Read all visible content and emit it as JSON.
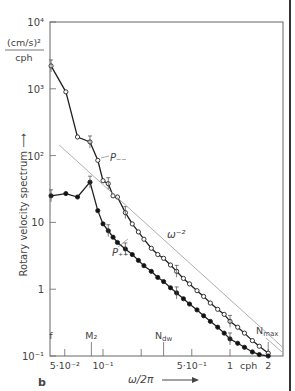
{
  "chart_data": {
    "type": "line",
    "panel_label": "b",
    "title": "",
    "xlabel": "ω/2π",
    "ylabel": "Rotary velocity spectrum",
    "y_units": {
      "numerator": "(cm/s)²",
      "denominator": "cph"
    },
    "x_scale": "log",
    "y_scale": "log",
    "xlim": [
      0.038,
      2.6
    ],
    "ylim": [
      0.1,
      10000
    ],
    "x_ticks": [
      {
        "value": 0.05,
        "label": "5·10⁻²"
      },
      {
        "value": 0.1,
        "label": "10⁻¹"
      },
      {
        "value": 0.2,
        "label": ""
      },
      {
        "value": 0.5,
        "label": "5·10⁻¹"
      },
      {
        "value": 1,
        "label": "1"
      },
      {
        "value": 2,
        "label": "2"
      }
    ],
    "x_unit_label": "cph",
    "y_ticks": [
      {
        "value": 0.1,
        "label": "10⁻¹"
      },
      {
        "value": 1,
        "label": "1"
      },
      {
        "value": 10,
        "label": "10"
      },
      {
        "value": 100,
        "label": "10²"
      },
      {
        "value": 1000,
        "label": "10³"
      },
      {
        "value": 10000,
        "label": "10⁴"
      }
    ],
    "frequency_markers": [
      {
        "label": "f",
        "x": 0.039
      },
      {
        "label": "M₂",
        "x": 0.081
      },
      {
        "label": "N_dw",
        "x": 0.3
      },
      {
        "label": "N_max",
        "x": 2.0
      }
    ],
    "series": [
      {
        "name": "P₋₋",
        "marker": "open-circle",
        "x": [
          0.039,
          0.051,
          0.063,
          0.079,
          0.091,
          0.1,
          0.11,
          0.12,
          0.13,
          0.15,
          0.17,
          0.19,
          0.21,
          0.24,
          0.27,
          0.3,
          0.34,
          0.38,
          0.43,
          0.48,
          0.55,
          0.62,
          0.7,
          0.8,
          0.9,
          1.0,
          1.15,
          1.3,
          1.5,
          1.7,
          2.0
        ],
        "values": [
          2200,
          900,
          190,
          160,
          85,
          42,
          38,
          25,
          24,
          14,
          9.5,
          7.2,
          5.6,
          4.1,
          3.3,
          2.9,
          2.3,
          1.85,
          1.45,
          1.2,
          0.95,
          0.78,
          0.62,
          0.5,
          0.42,
          0.33,
          0.27,
          0.22,
          0.17,
          0.14,
          0.11
        ]
      },
      {
        "name": "P₊₊",
        "marker": "filled-circle",
        "x": [
          0.039,
          0.051,
          0.063,
          0.079,
          0.091,
          0.1,
          0.11,
          0.12,
          0.13,
          0.15,
          0.17,
          0.19,
          0.21,
          0.24,
          0.27,
          0.3,
          0.34,
          0.38,
          0.43,
          0.48,
          0.55,
          0.62,
          0.7,
          0.8,
          0.9,
          1.0,
          1.15,
          1.3,
          1.5,
          1.7,
          2.0
        ],
        "values": [
          25,
          27,
          24,
          40,
          15,
          9.5,
          7.5,
          6.0,
          5.0,
          4.0,
          3.3,
          2.7,
          2.25,
          1.85,
          1.5,
          1.3,
          1.05,
          0.88,
          0.72,
          0.6,
          0.49,
          0.4,
          0.33,
          0.27,
          0.22,
          0.18,
          0.155,
          0.135,
          0.115,
          0.105,
          0.1
        ]
      },
      {
        "name": "ω⁻²",
        "marker": "none",
        "style": "thin-reference-line",
        "x": [
          0.045,
          2.6
        ],
        "values": [
          145,
          0.135
        ]
      }
    ],
    "annotations": [
      {
        "text": "P₋₋",
        "near_series": "P₋₋"
      },
      {
        "text": "P₊₊",
        "near_series": "P₊₊"
      },
      {
        "text": "ω⁻²",
        "near_series": "ω⁻²"
      }
    ],
    "grid": false,
    "legend": "none (inline labels)"
  }
}
